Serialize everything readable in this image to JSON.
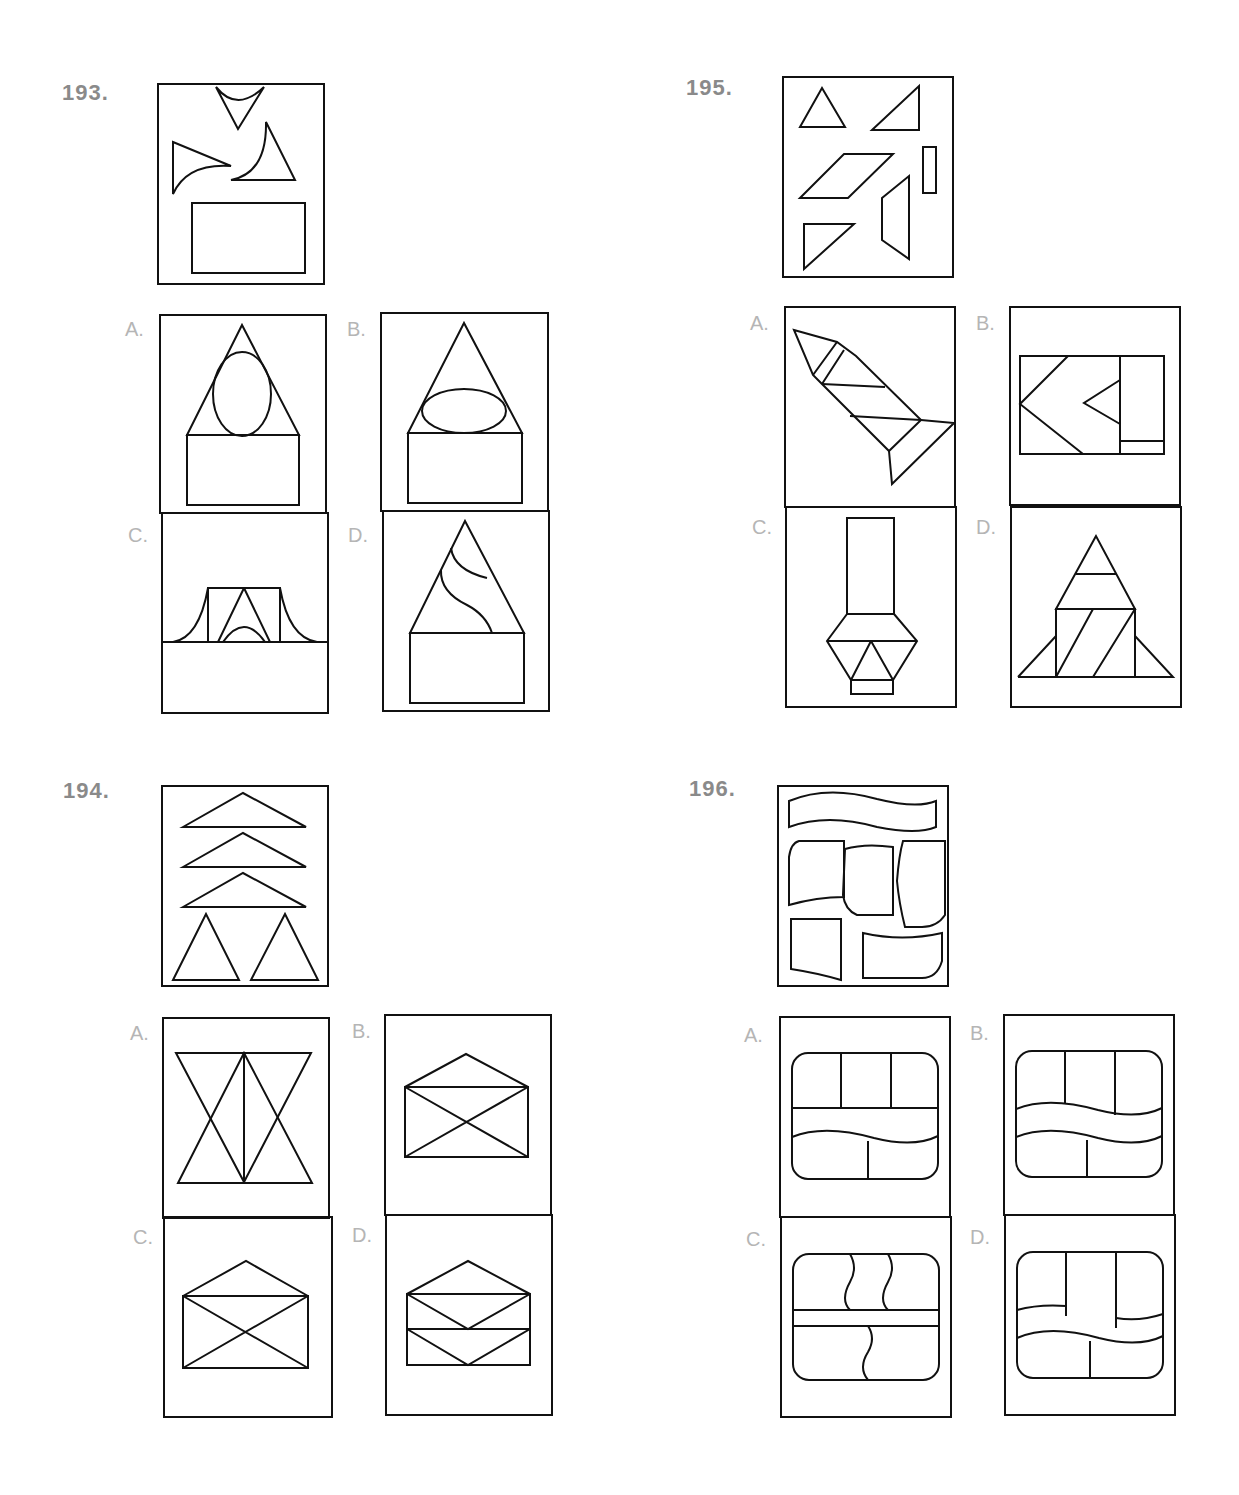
{
  "page": {
    "problems": [
      {
        "number": "193.",
        "pieces_description": "Three curved-edge triangles and one rectangle",
        "options": [
          {
            "label": "A.",
            "description": "Triangle over rectangle with tall ellipse inside triangle"
          },
          {
            "label": "B.",
            "description": "Triangle over rectangle with wide ellipse inside triangle"
          },
          {
            "label": "C.",
            "description": "Wide base with square, small triangle and concave flares"
          },
          {
            "label": "D.",
            "description": "Triangle with two S-curves over rectangle"
          }
        ]
      },
      {
        "number": "194.",
        "pieces_description": "Three wide flat triangles and two tall triangles",
        "options": [
          {
            "label": "A.",
            "description": "Two hourglass crosses with vertical center line"
          },
          {
            "label": "B.",
            "description": "Envelope with flap and X"
          },
          {
            "label": "C.",
            "description": "Envelope with large flap and X"
          },
          {
            "label": "D.",
            "description": "Envelope with flap and two stacked V sections"
          }
        ]
      },
      {
        "number": "195.",
        "pieces_description": "Two triangles, parallelogram, thin rectangle, trapezoid, right triangle",
        "options": [
          {
            "label": "A.",
            "description": "Diagonal rocket shape"
          },
          {
            "label": "B.",
            "description": "Rectangle with chevrons and side panel"
          },
          {
            "label": "C.",
            "description": "Tall rectangle on hexagon base (lamp)"
          },
          {
            "label": "D.",
            "description": "Rocket with triangular fins"
          }
        ]
      },
      {
        "number": "196.",
        "pieces_description": "Wavy band and five curved-edge quadrilaterals",
        "options": [
          {
            "label": "A.",
            "description": "Rounded rect, three top cells, one wavy band, two bottom cells"
          },
          {
            "label": "B.",
            "description": "Rounded rect with wavy band between top and bottom cells"
          },
          {
            "label": "C.",
            "description": "Rounded rect with vertical wavy dividers and horizontal strip"
          },
          {
            "label": "D.",
            "description": "Rounded rect with tall center cell and wavy side divisions"
          }
        ]
      }
    ]
  }
}
